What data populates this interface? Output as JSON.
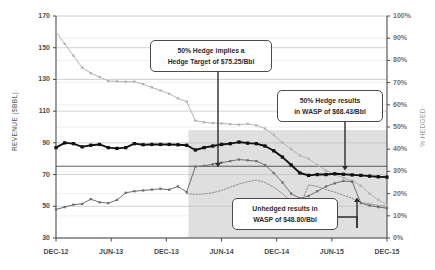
{
  "chart_data": {
    "type": "line",
    "title": "",
    "xlabel": "",
    "ylabel": "REVENUE ($BBL)",
    "ylabel_right": "% HEDGED",
    "ylim": [
      30,
      170
    ],
    "ylim_right": [
      0,
      100
    ],
    "grid": true,
    "legend_position": "none",
    "x_tick_labels": [
      "DEC-12",
      "JUN-13",
      "DEC-13",
      "JUN-14",
      "DEC-14",
      "JUN-15",
      "DEC-15"
    ],
    "y_tick_labels_left": [
      "170",
      "150",
      "130",
      "110",
      "90",
      "70",
      "50",
      "30"
    ],
    "y_tick_labels_right": [
      "100%",
      "90%",
      "80%",
      "70%",
      "60%",
      "50%",
      "40%",
      "30%",
      "20%",
      "10%",
      "0%"
    ],
    "hedge_target_line": 75.25,
    "shaded_band": {
      "x_start": "DEC-13",
      "x_end": "DEC-15",
      "y_low": 30,
      "y_high": 98
    },
    "series": [
      {
        "name": "Strip Price (unhedged outlook)",
        "color": "#b3b3b3",
        "style": "solid-markers",
        "values": [
          160.0,
          152.5,
          145.0,
          137.5,
          134.0,
          131.5,
          129.0,
          128.8,
          128.5,
          128.6,
          127.0,
          125.0,
          123.0,
          121.0,
          118.0,
          116.0,
          104.0,
          103.0,
          102.5,
          102.2,
          101.8,
          101.5,
          102.0,
          101.0,
          99.0,
          95.0,
          90.0,
          86.0,
          82.0,
          80.0,
          76.0,
          72.5,
          70.0,
          68.0,
          66.0,
          63.0,
          58.0,
          54.0,
          51.0
        ]
      },
      {
        "name": "50% Hedge WASP",
        "color": "#111111",
        "style": "bold-square-markers",
        "values": [
          87.0,
          90.0,
          89.5,
          87.5,
          88.5,
          89.0,
          87.0,
          86.5,
          87.0,
          89.5,
          88.8,
          89.0,
          89.0,
          89.0,
          88.8,
          88.5,
          85.5,
          87.0,
          88.0,
          89.0,
          89.5,
          90.5,
          89.8,
          89.5,
          88.0,
          85.0,
          81.0,
          76.0,
          71.0,
          69.5,
          70.0,
          70.0,
          70.5,
          70.2,
          69.8,
          69.5,
          69.0,
          68.6,
          68.4
        ]
      },
      {
        "name": "Unhedged WASP",
        "color": "#6e6e6e",
        "style": "solid-markers",
        "values": [
          48.0,
          49.5,
          51.0,
          51.5,
          54.5,
          52.5,
          52.0,
          54.0,
          58.5,
          59.5,
          60.0,
          60.5,
          61.0,
          60.5,
          62.5,
          59.0,
          75.0,
          75.5,
          76.5,
          77.5,
          78.5,
          79.5,
          79.0,
          78.5,
          76.0,
          71.0,
          65.0,
          58.0,
          55.0,
          56.5,
          59.5,
          62.5,
          64.5,
          66.0,
          65.5,
          52.0,
          50.5,
          49.5,
          48.8
        ]
      },
      {
        "name": "Hedge Coverage",
        "color": "#8a8a8a",
        "style": "dotted",
        "values": [
          null,
          null,
          null,
          null,
          null,
          null,
          null,
          null,
          null,
          null,
          null,
          null,
          null,
          null,
          null,
          58.0,
          57.5,
          57.8,
          58.5,
          60.0,
          62.0,
          64.0,
          65.5,
          66.5,
          65.0,
          62.0,
          58.0,
          53.0,
          50.0,
          63.5,
          62.5,
          60.5,
          59.0,
          57.0,
          55.0,
          52.5,
          51.5,
          50.5,
          50.0
        ]
      }
    ],
    "annotations": [
      {
        "id": "hedge-target-callout",
        "lines": [
          "50% Hedge implies a",
          "Hedge Target of $75.25/Bbl"
        ],
        "arrow_to_value": 75.25
      },
      {
        "id": "hedge-wasp-callout",
        "lines": [
          "50% Hedge results",
          "in WASP of $68.43/Bbl"
        ],
        "arrow_to_value": 68.43
      },
      {
        "id": "unhedged-wasp-callout",
        "lines": [
          "Unhedged results in",
          "WASP of $48.80/Bbl"
        ],
        "arrow_to_value": 48.8
      }
    ]
  }
}
